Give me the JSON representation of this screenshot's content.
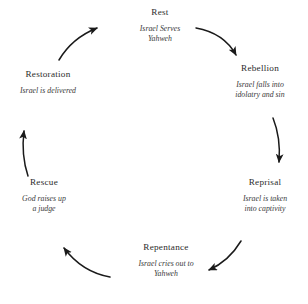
{
  "diagram": {
    "type": "cycle",
    "direction": "clockwise",
    "background_color": "#ffffff",
    "text_color": "#2b2b2b",
    "arrow_color": "#1a1a1a",
    "stages": [
      {
        "id": "rest",
        "title": "Rest",
        "description": "Israel Serves\nYahweh",
        "position": "top"
      },
      {
        "id": "rebellion",
        "title": "Rebellion",
        "description": "Israel falls into\nidolatry and sin",
        "position": "top-right"
      },
      {
        "id": "reprisal",
        "title": "Reprisal",
        "description": "Israel is taken\ninto captivity",
        "position": "bottom-right"
      },
      {
        "id": "repentance",
        "title": "Repentance",
        "description": "Israel cries out to\nYahweh",
        "position": "bottom"
      },
      {
        "id": "rescue",
        "title": "Rescue",
        "description": "God raises up\na judge",
        "position": "bottom-left"
      },
      {
        "id": "restoration",
        "title": "Restoration",
        "description": "Israel is delivered",
        "position": "top-left"
      }
    ],
    "arrows": [
      {
        "id": "rest-to-rebellion",
        "from": "rest",
        "to": "rebellion"
      },
      {
        "id": "rebellion-to-reprisal",
        "from": "rebellion",
        "to": "reprisal"
      },
      {
        "id": "reprisal-to-repentance",
        "from": "reprisal",
        "to": "repentance"
      },
      {
        "id": "repentance-to-rescue",
        "from": "repentance",
        "to": "rescue"
      },
      {
        "id": "rescue-to-restoration",
        "from": "rescue",
        "to": "restoration"
      },
      {
        "id": "restoration-to-rest",
        "from": "restoration",
        "to": "rest"
      }
    ]
  }
}
